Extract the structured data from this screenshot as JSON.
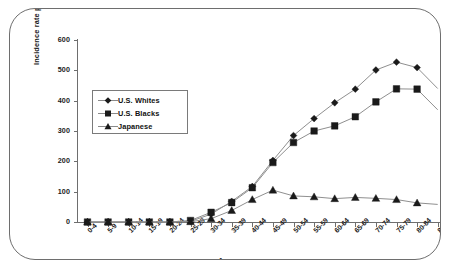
{
  "chart_data": {
    "type": "line",
    "title": "",
    "xlabel": "Age group",
    "ylabel": "Incidence rate per 100,000",
    "ylim": [
      0,
      600
    ],
    "yticks": [
      0,
      100,
      200,
      300,
      400,
      500,
      600
    ],
    "grid": false,
    "legend_position": "inside upper-left",
    "categories": [
      "0-4",
      "5-9",
      "10-14",
      "15-19",
      "20-24",
      "25-29",
      "30-34",
      "35-39",
      "40-44",
      "45-49",
      "50-54",
      "55-59",
      "60-64",
      "65-69",
      "70-74",
      "75-79",
      "80-84",
      "85-89"
    ],
    "series": [
      {
        "name": "U.S. Whites",
        "marker": "diamond",
        "values": [
          0,
          0,
          0,
          0,
          0,
          2,
          26,
          68,
          117,
          203,
          285,
          341,
          393,
          438,
          501,
          527,
          509,
          440
        ]
      },
      {
        "name": "U.S. Blacks",
        "marker": "square",
        "values": [
          0,
          0,
          0,
          0,
          0,
          5,
          32,
          64,
          113,
          196,
          262,
          300,
          317,
          347,
          396,
          439,
          438,
          370
        ]
      },
      {
        "name": "Japanese",
        "marker": "triangle",
        "values": [
          0,
          0,
          0,
          0,
          0,
          1,
          11,
          38,
          74,
          105,
          86,
          83,
          77,
          81,
          78,
          74,
          63,
          58
        ]
      }
    ]
  },
  "axis": {
    "y_title": "Incidence rate per 100,000",
    "x_title": "Age group",
    "y_tick_labels": [
      "0",
      "100",
      "200",
      "300",
      "400",
      "500",
      "600"
    ]
  },
  "legend": {
    "items": [
      {
        "label": "U.S. Whites",
        "marker": "diamond-marker-icon"
      },
      {
        "label": "U.S. Blacks",
        "marker": "square-marker-icon"
      },
      {
        "label": "Japanese",
        "marker": "triangle-marker-icon"
      }
    ]
  },
  "colors": {
    "series_marker": "#1a1a1a",
    "series_line": "#8f8f8f",
    "axis": "#6e6e6e",
    "text": "#1a1a1a",
    "frame": "#6e6e6e",
    "background": "#ffffff"
  }
}
